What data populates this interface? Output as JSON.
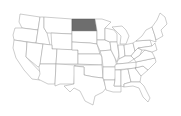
{
  "map": {
    "title": "United States",
    "highlighted_state": "North Dakota",
    "colors": {
      "background": "#ffffff",
      "state_fill": "#ffffff",
      "state_border": "#9a9a9a",
      "highlight_fill": "#6e6e6e"
    },
    "states": [
      {
        "id": "WA",
        "name": "Washington",
        "highlighted": false
      },
      {
        "id": "OR",
        "name": "Oregon",
        "highlighted": false
      },
      {
        "id": "CA",
        "name": "California",
        "highlighted": false
      },
      {
        "id": "ID",
        "name": "Idaho",
        "highlighted": false
      },
      {
        "id": "NV",
        "name": "Nevada",
        "highlighted": false
      },
      {
        "id": "MT",
        "name": "Montana",
        "highlighted": false
      },
      {
        "id": "WY",
        "name": "Wyoming",
        "highlighted": false
      },
      {
        "id": "UT",
        "name": "Utah",
        "highlighted": false
      },
      {
        "id": "AZ",
        "name": "Arizona",
        "highlighted": false
      },
      {
        "id": "CO",
        "name": "Colorado",
        "highlighted": false
      },
      {
        "id": "NM",
        "name": "New Mexico",
        "highlighted": false
      },
      {
        "id": "ND",
        "name": "North Dakota",
        "highlighted": true
      },
      {
        "id": "SD",
        "name": "South Dakota",
        "highlighted": false
      },
      {
        "id": "NE",
        "name": "Nebraska",
        "highlighted": false
      },
      {
        "id": "KS",
        "name": "Kansas",
        "highlighted": false
      },
      {
        "id": "OK",
        "name": "Oklahoma",
        "highlighted": false
      },
      {
        "id": "TX",
        "name": "Texas",
        "highlighted": false
      },
      {
        "id": "MN",
        "name": "Minnesota",
        "highlighted": false
      },
      {
        "id": "IA",
        "name": "Iowa",
        "highlighted": false
      },
      {
        "id": "MO",
        "name": "Missouri",
        "highlighted": false
      },
      {
        "id": "AR",
        "name": "Arkansas",
        "highlighted": false
      },
      {
        "id": "LA",
        "name": "Louisiana",
        "highlighted": false
      },
      {
        "id": "WI",
        "name": "Wisconsin",
        "highlighted": false
      },
      {
        "id": "IL",
        "name": "Illinois",
        "highlighted": false
      },
      {
        "id": "MI",
        "name": "Michigan",
        "highlighted": false
      },
      {
        "id": "IN",
        "name": "Indiana",
        "highlighted": false
      },
      {
        "id": "OH",
        "name": "Ohio",
        "highlighted": false
      },
      {
        "id": "KY",
        "name": "Kentucky",
        "highlighted": false
      },
      {
        "id": "TN",
        "name": "Tennessee",
        "highlighted": false
      },
      {
        "id": "MS",
        "name": "Mississippi",
        "highlighted": false
      },
      {
        "id": "AL",
        "name": "Alabama",
        "highlighted": false
      },
      {
        "id": "GA",
        "name": "Georgia",
        "highlighted": false
      },
      {
        "id": "FL",
        "name": "Florida",
        "highlighted": false
      },
      {
        "id": "SC",
        "name": "South Carolina",
        "highlighted": false
      },
      {
        "id": "NC",
        "name": "North Carolina",
        "highlighted": false
      },
      {
        "id": "VA",
        "name": "Virginia",
        "highlighted": false
      },
      {
        "id": "WV",
        "name": "West Virginia",
        "highlighted": false
      },
      {
        "id": "PA",
        "name": "Pennsylvania",
        "highlighted": false
      },
      {
        "id": "NY",
        "name": "New York",
        "highlighted": false
      },
      {
        "id": "NE_states",
        "name": "New England",
        "highlighted": false
      }
    ]
  }
}
